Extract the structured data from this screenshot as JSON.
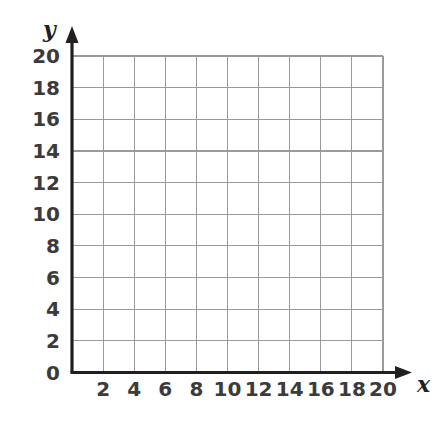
{
  "figure": {
    "kind": "empty-coordinate-grid",
    "background_color": "#ffffff",
    "axis_color": "#231f20",
    "grid_color": "#9a9a9a",
    "label_color": "#3b3b3b"
  },
  "axes": {
    "x_axis_name": "x",
    "y_axis_name": "y",
    "origin_label": "0"
  },
  "chart_data": {
    "type": "scatter",
    "title": "",
    "subtitle": "",
    "xlabel": "x",
    "ylabel": "y",
    "xlim": [
      0,
      20
    ],
    "ylim": [
      0,
      20
    ],
    "x_tick_step": 2,
    "y_tick_step": 2,
    "x_ticks": [
      0,
      2,
      4,
      6,
      8,
      10,
      12,
      14,
      16,
      18,
      20
    ],
    "y_ticks": [
      0,
      2,
      4,
      6,
      8,
      10,
      12,
      14,
      16,
      18,
      20
    ],
    "x_tick_labels": [
      "2",
      "4",
      "6",
      "8",
      "10",
      "12",
      "14",
      "16",
      "18",
      "20"
    ],
    "y_tick_labels": [
      "20",
      "18",
      "16",
      "14",
      "12",
      "10",
      "8",
      "6",
      "4",
      "2",
      "0"
    ],
    "grid": true,
    "legend": null,
    "series": [],
    "values": [],
    "annotations": []
  }
}
